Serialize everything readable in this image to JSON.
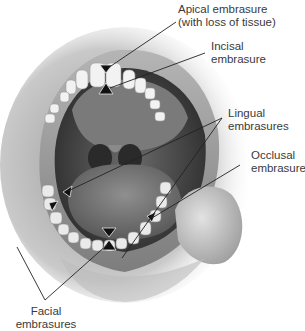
{
  "figure": {
    "labels": {
      "apical": {
        "line1": "Apical embrasure",
        "line2": "(with loss of tissue)"
      },
      "incisal": {
        "line1": "Incisal",
        "line2": "embrasure"
      },
      "lingual": {
        "line1": "Lingual",
        "line2": "embrasures"
      },
      "occlusal": {
        "line1": "Occlusal",
        "line2": "embrasure"
      },
      "facial": {
        "line1": "Facial",
        "line2": "embrasures"
      }
    },
    "colors": {
      "background": "#ffffff",
      "text": "#3a3a3a",
      "leader_line": "#222222",
      "marker_fill": "#111111",
      "marker_outline": "#e8e8e8"
    }
  }
}
